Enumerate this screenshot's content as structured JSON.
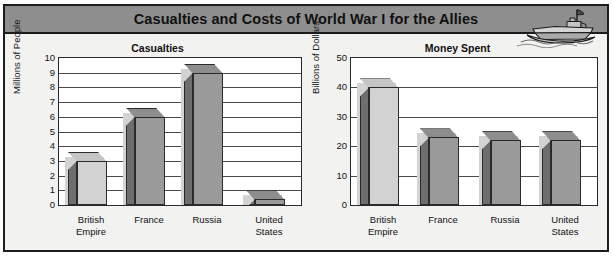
{
  "header": {
    "title": "Casualties and Costs of World War I for the Allies",
    "icon": "battleship-icon",
    "bar_color": "#8e8e8e"
  },
  "colors": {
    "frame": "#1c1c1c",
    "background": "#f2f2f0",
    "plot_background": "#ffffff",
    "gridline": "#4a4a4a",
    "bar_light": "#d2d2d2",
    "bar_mid": "#9a9a9a",
    "bar_dark": "#6e6e6e",
    "bar_outline": "#2b2b2b"
  },
  "chart_data": [
    {
      "type": "bar",
      "title": "Casualties",
      "xlabel": "",
      "ylabel": "Millions of People",
      "categories": [
        "British Empire",
        "France",
        "Russia",
        "United States"
      ],
      "values": [
        3,
        6,
        9,
        0.4
      ],
      "ylim": [
        0,
        10
      ],
      "yticks": [
        0,
        1,
        2,
        3,
        4,
        5,
        6,
        7,
        8,
        9,
        10
      ],
      "grid": true,
      "legend": "none",
      "bar_style": "3d",
      "bar_shades": [
        "#d2d2d2",
        "#9a9a9a",
        "#9a9a9a",
        "#9a9a9a"
      ]
    },
    {
      "type": "bar",
      "title": "Money Spent",
      "xlabel": "",
      "ylabel": "Billions of Dollars",
      "categories": [
        "British Empire",
        "France",
        "Russia",
        "United States"
      ],
      "values": [
        40,
        23,
        22,
        22
      ],
      "ylim": [
        0,
        50
      ],
      "yticks": [
        0,
        10,
        20,
        30,
        40,
        50
      ],
      "grid": true,
      "legend": "none",
      "bar_style": "3d",
      "bar_shades": [
        "#d2d2d2",
        "#9a9a9a",
        "#9a9a9a",
        "#9a9a9a"
      ]
    }
  ]
}
